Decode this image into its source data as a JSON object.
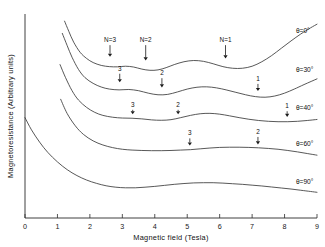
{
  "figure": {
    "background_color": "#ffffff",
    "curve_color": "#3a3a3a",
    "axis_color": "#2b2b2b"
  },
  "axes": {
    "x_title": "Magnetic field (Tesla)",
    "y_title": "Magnetoresistance (Arbitrary units)",
    "x_ticks": [
      "0",
      "1",
      "2",
      "3",
      "4",
      "5",
      "6",
      "7",
      "8",
      "9"
    ],
    "y_ticks": []
  },
  "curve_labels": [
    {
      "text": "θ=0°"
    },
    {
      "text": "θ=30°"
    },
    {
      "text": "θ=40°"
    },
    {
      "text": "θ=60°"
    },
    {
      "text": "θ=90°"
    }
  ],
  "arrow_labels": [
    {
      "text": "N=3"
    },
    {
      "text": "N=2"
    },
    {
      "text": "N=1"
    },
    {
      "text": "3"
    },
    {
      "text": "2"
    },
    {
      "text": "1"
    },
    {
      "text": "3"
    },
    {
      "text": "2"
    },
    {
      "text": "1"
    },
    {
      "text": "3"
    },
    {
      "text": "2"
    }
  ],
  "chart_data": {
    "type": "line",
    "title": "",
    "xlabel": "Magnetic field (Tesla)",
    "ylabel": "Magnetoresistance (Arbitrary units)",
    "xlim": [
      0,
      9
    ],
    "ylim": [
      0,
      1
    ],
    "grid": false,
    "legend_position": "right-inline",
    "xticks": [
      0,
      1,
      2,
      3,
      4,
      5,
      6,
      7,
      8,
      9
    ],
    "yticks": [],
    "series": [
      {
        "name": "θ=0°",
        "label_x": 8.35,
        "label_y": 0.905,
        "x": [
          1.22,
          1.35,
          1.5,
          1.7,
          1.9,
          2.1,
          2.35,
          2.6,
          2.85,
          3.1,
          3.35,
          3.6,
          3.85,
          4.1,
          4.35,
          4.6,
          4.9,
          5.2,
          5.5,
          5.8,
          6.1,
          6.4,
          6.7,
          7.0,
          7.3,
          7.6,
          7.9,
          8.2,
          8.5,
          8.8,
          9.0
        ],
        "y": [
          0.965,
          0.915,
          0.862,
          0.812,
          0.782,
          0.762,
          0.748,
          0.742,
          0.741,
          0.744,
          0.74,
          0.73,
          0.724,
          0.726,
          0.737,
          0.752,
          0.766,
          0.772,
          0.768,
          0.756,
          0.742,
          0.734,
          0.734,
          0.744,
          0.766,
          0.796,
          0.832,
          0.868,
          0.902,
          0.932,
          0.95
        ]
      },
      {
        "name": "θ=30°",
        "label_x": 8.35,
        "label_y": 0.715,
        "x": [
          1.15,
          1.3,
          1.45,
          1.65,
          1.85,
          2.1,
          2.35,
          2.6,
          2.9,
          3.2,
          3.5,
          3.8,
          4.1,
          4.4,
          4.7,
          5.0,
          5.3,
          5.6,
          5.9,
          6.2,
          6.5,
          6.8,
          7.1,
          7.4,
          7.7,
          8.0,
          8.3,
          8.6,
          9.0
        ],
        "y": [
          0.905,
          0.845,
          0.788,
          0.728,
          0.688,
          0.66,
          0.642,
          0.632,
          0.628,
          0.63,
          0.624,
          0.612,
          0.604,
          0.606,
          0.618,
          0.632,
          0.641,
          0.643,
          0.638,
          0.628,
          0.616,
          0.604,
          0.595,
          0.592,
          0.598,
          0.612,
          0.632,
          0.654,
          0.682
        ]
      },
      {
        "name": "θ=40°",
        "label_x": 8.35,
        "label_y": 0.528,
        "x": [
          1.08,
          1.25,
          1.45,
          1.65,
          1.9,
          2.15,
          2.4,
          2.7,
          3.0,
          3.3,
          3.6,
          3.9,
          4.2,
          4.5,
          4.8,
          5.1,
          5.4,
          5.7,
          6.0,
          6.3,
          6.6,
          6.9,
          7.2,
          7.5,
          7.8,
          8.1,
          8.4,
          8.7,
          9.0
        ],
        "y": [
          0.752,
          0.688,
          0.624,
          0.578,
          0.542,
          0.518,
          0.503,
          0.494,
          0.49,
          0.489,
          0.486,
          0.481,
          0.479,
          0.482,
          0.492,
          0.503,
          0.511,
          0.513,
          0.509,
          0.501,
          0.492,
          0.484,
          0.478,
          0.474,
          0.472,
          0.472,
          0.474,
          0.478,
          0.483
        ]
      },
      {
        "name": "θ=60°",
        "label_x": 8.35,
        "label_y": 0.352,
        "x": [
          1.1,
          1.3,
          1.55,
          1.8,
          2.1,
          2.4,
          2.7,
          3.0,
          3.3,
          3.6,
          3.9,
          4.2,
          4.5,
          4.8,
          5.1,
          5.4,
          5.7,
          6.0,
          6.3,
          6.6,
          6.9,
          7.2,
          7.5,
          7.8,
          8.1,
          8.4,
          8.7,
          9.0
        ],
        "y": [
          0.582,
          0.512,
          0.452,
          0.41,
          0.378,
          0.358,
          0.345,
          0.337,
          0.333,
          0.331,
          0.33,
          0.33,
          0.331,
          0.333,
          0.335,
          0.339,
          0.343,
          0.346,
          0.347,
          0.347,
          0.346,
          0.344,
          0.341,
          0.337,
          0.331,
          0.324,
          0.316,
          0.308
        ]
      },
      {
        "name": "θ=90°",
        "label_x": 8.35,
        "label_y": 0.168,
        "x": [
          0.0,
          0.2,
          0.45,
          0.7,
          1.0,
          1.3,
          1.6,
          1.9,
          2.2,
          2.5,
          2.8,
          3.1,
          3.4,
          3.7,
          4.0,
          4.3,
          4.6,
          4.9,
          5.2,
          5.5,
          5.8,
          6.1,
          6.4,
          6.7,
          7.0,
          7.3,
          7.6,
          7.9,
          8.2,
          8.5,
          8.8,
          9.0
        ],
        "y": [
          0.492,
          0.432,
          0.372,
          0.322,
          0.275,
          0.237,
          0.208,
          0.186,
          0.17,
          0.158,
          0.151,
          0.148,
          0.148,
          0.151,
          0.155,
          0.16,
          0.165,
          0.169,
          0.172,
          0.173,
          0.173,
          0.171,
          0.168,
          0.165,
          0.161,
          0.157,
          0.152,
          0.147,
          0.142,
          0.136,
          0.13,
          0.126
        ]
      }
    ],
    "annotations": [
      {
        "text": "N=3",
        "x": 2.62,
        "y_label": 0.862,
        "y_tip": 0.79,
        "series": "θ=0°"
      },
      {
        "text": "N=2",
        "x": 3.72,
        "y_label": 0.862,
        "y_tip": 0.772,
        "series": "θ=0°"
      },
      {
        "text": "N=1",
        "x": 6.18,
        "y_label": 0.862,
        "y_tip": 0.782,
        "series": "θ=0°"
      },
      {
        "text": "3",
        "x": 2.92,
        "y_label": 0.722,
        "y_tip": 0.665,
        "series": "θ=30°"
      },
      {
        "text": "2",
        "x": 4.22,
        "y_label": 0.7,
        "y_tip": 0.64,
        "series": "θ=30°"
      },
      {
        "text": "1",
        "x": 7.18,
        "y_label": 0.672,
        "y_tip": 0.622,
        "series": "θ=30°"
      },
      {
        "text": "3",
        "x": 3.32,
        "y_label": 0.545,
        "y_tip": 0.508,
        "series": "θ=40°"
      },
      {
        "text": "2",
        "x": 4.72,
        "y_label": 0.545,
        "y_tip": 0.508,
        "series": "θ=40°"
      },
      {
        "text": "1",
        "x": 8.08,
        "y_label": 0.538,
        "y_tip": 0.495,
        "series": "θ=40°"
      },
      {
        "text": "3",
        "x": 5.08,
        "y_label": 0.405,
        "y_tip": 0.355,
        "series": "θ=60°"
      },
      {
        "text": "2",
        "x": 7.18,
        "y_label": 0.412,
        "y_tip": 0.36,
        "series": "θ=60°"
      }
    ]
  }
}
